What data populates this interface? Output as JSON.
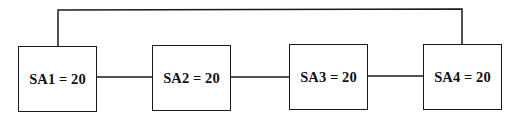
{
  "diagram": {
    "type": "network-topology",
    "nodes": [
      {
        "id": "SA1",
        "label": "SA1 = 20",
        "name": "SA1",
        "value": 20
      },
      {
        "id": "SA2",
        "label": "SA2 = 20",
        "name": "SA2",
        "value": 20
      },
      {
        "id": "SA3",
        "label": "SA3 = 20",
        "name": "SA3",
        "value": 20
      },
      {
        "id": "SA4",
        "label": "SA4 = 20",
        "name": "SA4",
        "value": 20
      }
    ],
    "edges": [
      {
        "from": "SA1",
        "to": "SA2"
      },
      {
        "from": "SA2",
        "to": "SA3"
      },
      {
        "from": "SA3",
        "to": "SA4"
      },
      {
        "from": "SA1",
        "to": "SA4",
        "route": "over-top"
      }
    ],
    "colors": {
      "line": "#1a1a1a",
      "background": "#ffffff",
      "text": "#111111"
    }
  }
}
